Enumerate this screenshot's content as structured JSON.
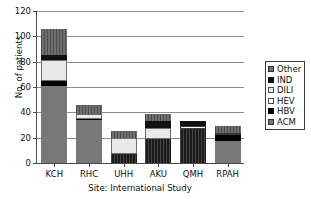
{
  "chart_data": {
    "type": "bar",
    "stacked": true,
    "title": "",
    "xlabel": "Site: International Study",
    "ylabel": "No. of patients",
    "categories": [
      "KCH",
      "RHC",
      "UHH",
      "AKU",
      "QMH",
      "RPAH"
    ],
    "ylim": [
      0,
      120
    ],
    "yticks": [
      0,
      20,
      40,
      60,
      80,
      100,
      120
    ],
    "grid": true,
    "legend_position": "right",
    "series": [
      {
        "name": "ACM",
        "color": "#787878",
        "values": [
          61,
          34,
          7,
          19,
          27,
          17
        ]
      },
      {
        "name": "HBV",
        "color": "#000000",
        "values": [
          4,
          1,
          0,
          0,
          0,
          5
        ]
      },
      {
        "name": "HEV",
        "color": "#ffffff",
        "values": [
          0,
          0,
          0,
          0,
          2,
          2
        ]
      },
      {
        "name": "DILI",
        "color": "#e9e9e9",
        "values": [
          16,
          4,
          13,
          9,
          0,
          0
        ]
      },
      {
        "name": "IND",
        "color": "#111111",
        "values": [
          4,
          0,
          0,
          5,
          4,
          0
        ]
      },
      {
        "name": "Other",
        "color": "#6f6f6f",
        "values": [
          21,
          7,
          5,
          6,
          0,
          5
        ]
      }
    ],
    "totals": [
      106,
      46,
      25,
      39,
      33,
      29
    ],
    "legend_entries": [
      "Other",
      "IND",
      "DILI",
      "HEV",
      "HBV",
      "ACM"
    ]
  }
}
